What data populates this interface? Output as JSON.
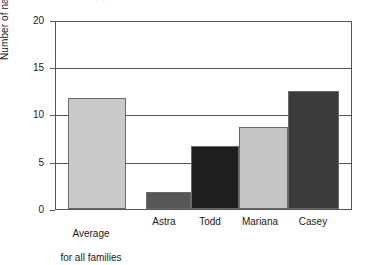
{
  "chart_data": {
    "type": "bar",
    "title": "",
    "xlabel": "",
    "ylabel": "Number of narratives",
    "ylim": [
      0,
      20
    ],
    "ytick_labels": [
      "0",
      "5",
      "10",
      "15",
      "20"
    ],
    "ytick_values": [
      0,
      5,
      10,
      15,
      20
    ],
    "gridlines": [
      5,
      10,
      15
    ],
    "grid": true,
    "legend": "none",
    "categories": [
      "Average\nfor all families",
      "Astra",
      "Todd",
      "Mariana",
      "Casey"
    ],
    "values": [
      11.9,
      1.8,
      6.7,
      8.8,
      12.6
    ],
    "bars": [
      {
        "label": "Average\nfor all families",
        "value": 11.9,
        "color": "#cacaca",
        "group": "average"
      },
      {
        "label": "Astra",
        "value": 1.8,
        "color": "#575757",
        "group": "family"
      },
      {
        "label": "Todd",
        "value": 6.7,
        "color": "#1e1e1e",
        "group": "family"
      },
      {
        "label": "Mariana",
        "value": 8.8,
        "color": "#c6c6c6",
        "group": "family"
      },
      {
        "label": "Casey",
        "value": 12.6,
        "color": "#3b3b3b",
        "group": "family"
      }
    ]
  },
  "axis": {
    "y_title": "Number of narratives",
    "tick_0": "0",
    "tick_5": "5",
    "tick_10": "10",
    "tick_15": "15",
    "tick_20": "20"
  },
  "labels": {
    "average_line1": "Average",
    "average_line2": "for all families",
    "astra": "Astra",
    "todd": "Todd",
    "mariana": "Mariana",
    "casey": "Casey"
  },
  "artifact": {
    "text": "·          ·      ·"
  },
  "colors": {
    "light_gray": "#cacaca",
    "mid_gray": "#575757",
    "near_black": "#1e1e1e",
    "dark_gray": "#3b3b3b",
    "axis": "#555555",
    "background": "#ffffff"
  }
}
